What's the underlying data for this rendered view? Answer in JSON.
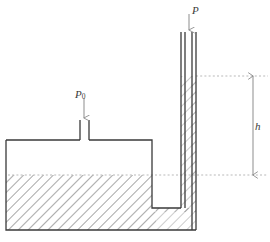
{
  "figure": {
    "type": "diagram",
    "labels": {
      "tube_pressure": "P",
      "tank_pressure_base": "P",
      "tank_pressure_sub": "0",
      "height": "h"
    },
    "colors": {
      "outline": "#3a3a3a",
      "hatch": "#8d8d8d",
      "dashed": "#b9b9b9",
      "dimension": "#8d8d8d",
      "arrow": "#8d8d8d",
      "background": "#ffffff"
    },
    "geometry": {
      "tank": {
        "left": 6,
        "top": 140,
        "right": 152,
        "bottom": 230
      },
      "tank_liquid_level_y": 175,
      "tube": {
        "outer_left": 181,
        "inner_left": 185,
        "inner_right": 192,
        "outer_right": 196,
        "top": 32
      },
      "tube_liquid_level_y": 76,
      "dimension_line_x": 253,
      "dashed_line_right_x": 268,
      "inlet_spout": {
        "left": 80,
        "right": 89,
        "top": 120
      }
    }
  }
}
